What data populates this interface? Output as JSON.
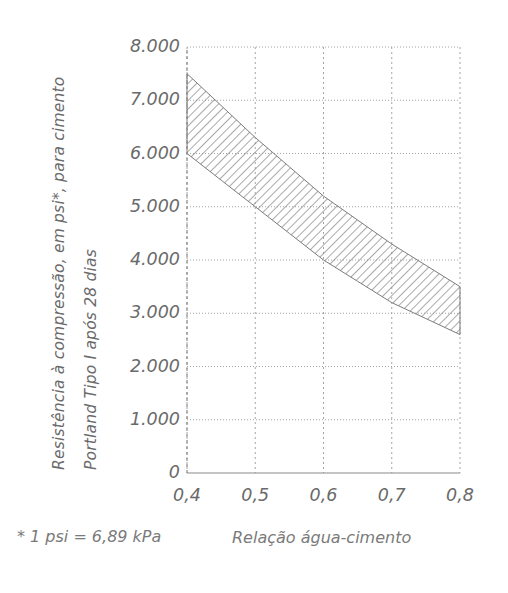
{
  "chart_data": {
    "type": "area",
    "title": "",
    "xlabel": "Relação água-cimento",
    "ylabel_lines": [
      "Resistência à compressão, em psi*, para cimento",
      "Portland Tipo I após 28 dias"
    ],
    "footnote": "* 1 psi = 6,89 kPa",
    "xlim": [
      0.4,
      0.8
    ],
    "ylim": [
      0,
      8000
    ],
    "grid": true,
    "legend": "none",
    "x_ticks": [
      0.4,
      0.5,
      0.6,
      0.7,
      0.8
    ],
    "x_tick_labels": [
      "0,4",
      "0,5",
      "0,6",
      "0,7",
      "0,8"
    ],
    "y_ticks": [
      0,
      1000,
      2000,
      3000,
      4000,
      5000,
      6000,
      7000,
      8000
    ],
    "y_tick_labels": [
      "0",
      "1.000",
      "2.000",
      "3.000",
      "4.000",
      "5.000",
      "6.000",
      "7.000",
      "8.000"
    ],
    "x": [
      0.4,
      0.45,
      0.5,
      0.55,
      0.6,
      0.65,
      0.7,
      0.75,
      0.8
    ],
    "series": [
      {
        "name": "Limite superior",
        "values": [
          7500,
          6900,
          6300,
          5750,
          5200,
          4750,
          4300,
          3900,
          3500
        ]
      },
      {
        "name": "Limite inferior",
        "values": [
          6000,
          5500,
          5000,
          4500,
          4000,
          3600,
          3200,
          2900,
          2600
        ]
      }
    ],
    "band_fill": "hatched-diagonal",
    "band_color": "#8a8a8a",
    "grid_color": "#9a9a9a",
    "axis_color": "#8f8f8f"
  },
  "axes": {
    "y_tick_labels": [
      "8.000",
      "7.000",
      "6.000",
      "5.000",
      "4.000",
      "3.000",
      "2.000",
      "1.000",
      "0"
    ],
    "x_tick_labels": [
      "0,4",
      "0,5",
      "0,6",
      "0,7",
      "0,8"
    ]
  },
  "labels": {
    "y_title_line1": "Resistência à compressão, em psi*, para cimento",
    "y_title_line2": "Portland Tipo I após 28 dias",
    "x_title": "Relação água-cimento",
    "footnote": "* 1 psi = 6,89 kPa"
  }
}
